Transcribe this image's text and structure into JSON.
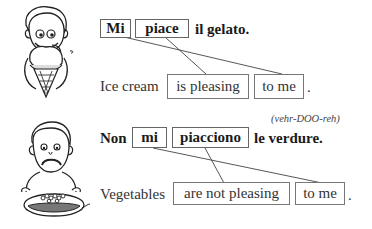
{
  "example1": {
    "italian": {
      "box1": "Mi",
      "box2": "piace",
      "rest": "il gelato."
    },
    "english": {
      "lead": "Ice cream",
      "box1": "is pleasing",
      "box2": "to me",
      "period": "."
    },
    "illustration": "boy-licking-ice-cream"
  },
  "example2": {
    "italian": {
      "lead": "Non",
      "box1": "mi",
      "box2": "piacciono",
      "rest": "le verdure."
    },
    "pronunciation": "(vehr-DOO-reh)",
    "english": {
      "lead": "Vegetables",
      "box1": "are not pleasing",
      "box2": "to me",
      "period": "."
    },
    "illustration": "boy-frowning-at-vegetables"
  }
}
